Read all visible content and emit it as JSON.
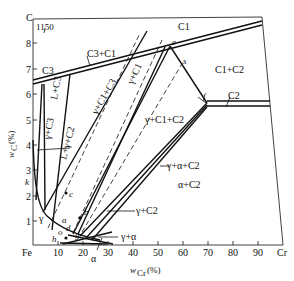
{
  "figure": {
    "temperature_label": "1150",
    "corner_top_left": "C",
    "corner_bottom_left": "Fe",
    "corner_bottom_right": "Cr"
  },
  "axes": {
    "x": {
      "label_main": "w",
      "label_sub": "Cr",
      "label_unit": "(%)",
      "ticks": [
        "10",
        "20",
        "30",
        "40",
        "50",
        "60",
        "70",
        "80",
        "90"
      ]
    },
    "y": {
      "label_main": "w",
      "label_sub": "C",
      "label_unit": "(%)",
      "ticks": [
        "1",
        "2",
        "3",
        "4",
        "5",
        "6",
        "7",
        "8"
      ]
    }
  },
  "regions": {
    "c1": "C1",
    "c3": "C3",
    "c3_c1": "C3+C1",
    "c1_c2": "C1+C2",
    "c2": "C2",
    "l_c3": "L+C3",
    "gamma_c3": "γ+C3",
    "l_gamma_c2": "L+γ+C2",
    "gamma_c1_c3": "γ+C1+C3",
    "gamma_c1": "γ+C1",
    "gamma_c1_c2": "γ+C1+C2",
    "gamma_alpha_c2": "γ+α+C2",
    "gamma_c2": "γ+C2",
    "alpha_c2": "α+C2",
    "gamma_alpha": "γ+α",
    "gamma": "γ",
    "alpha": "α"
  },
  "points": {
    "a": "a",
    "b": "b",
    "c": "c",
    "d": "d",
    "e": "e",
    "f": "f",
    "g": "g",
    "h": "h",
    "k": "k",
    "o": "o",
    "s": "s"
  }
}
